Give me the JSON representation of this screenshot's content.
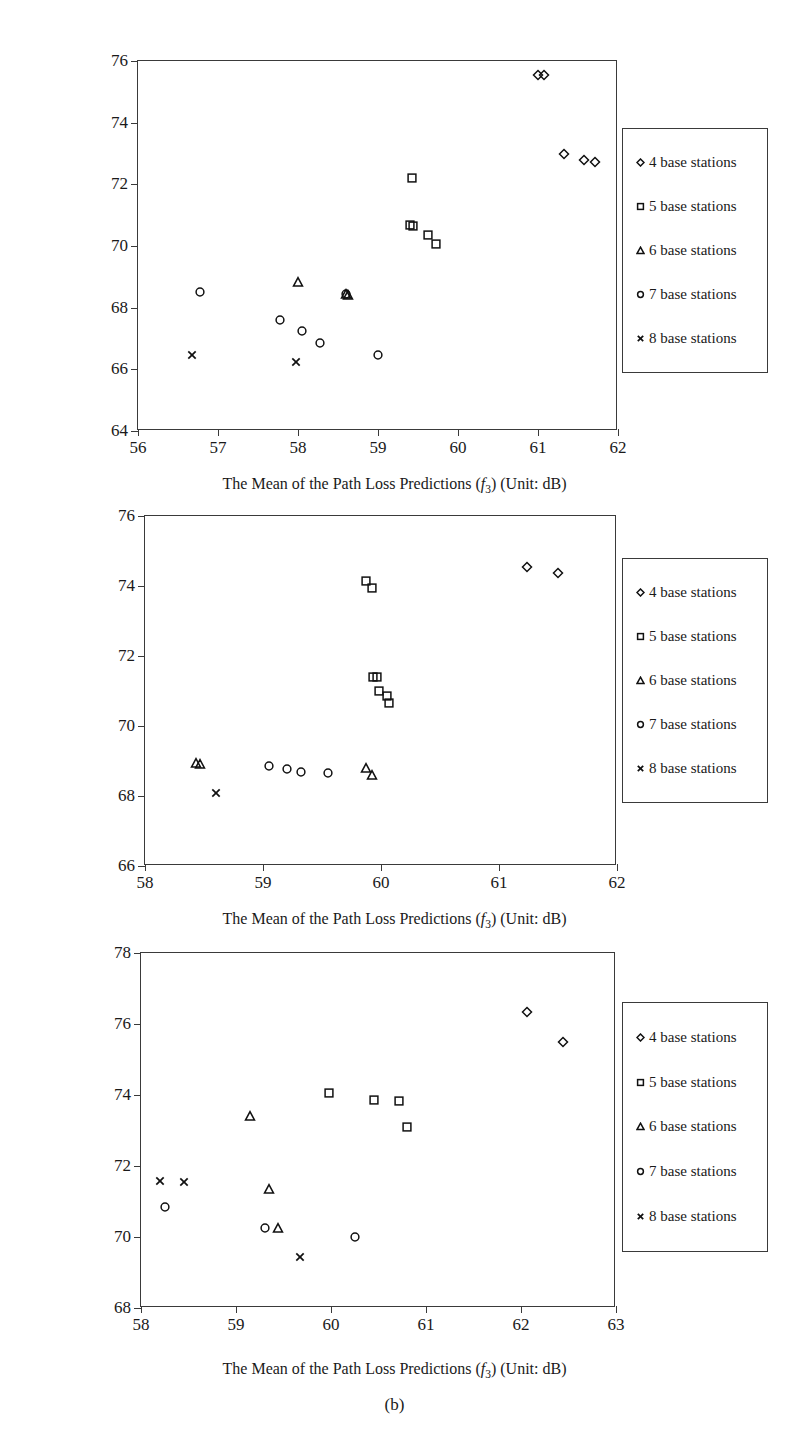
{
  "figure": {
    "caption": "(b)",
    "legend_labels": [
      "4 base stations",
      "5 base stations",
      "6 base stations",
      "7 base stations",
      "8 base stations"
    ],
    "legend_markers": [
      "diamond-marker",
      "square-marker",
      "triangle-marker",
      "circle-marker",
      "cross-marker"
    ],
    "axis_color": "#3a3a3a",
    "marker_color": "#111111"
  },
  "panels": [
    {
      "id": "a",
      "ylabel_line1": "The Mean of the Maximum Path Loss",
      "ylabel_line2": "predictions (f4) (Unit: dB)",
      "xlabel": "The Mean of the Path Loss Predictions (f3) (Unit: dB)",
      "xticks": [
        "56",
        "57",
        "58",
        "59",
        "60",
        "61",
        "62"
      ],
      "yticks": [
        "64",
        "66",
        "68",
        "70",
        "72",
        "74",
        "76"
      ]
    },
    {
      "id": "b",
      "ylabel_line1": "The Mean of the Maximum Path Loss",
      "ylabel_line2": "Predictions (f4) (Unit: dB)",
      "xlabel": "The Mean of the Path Loss Predictions (f3) (Unit: dB)",
      "xticks": [
        "58",
        "59",
        "60",
        "61",
        "62"
      ],
      "yticks": [
        "66",
        "68",
        "70",
        "72",
        "74",
        "76"
      ]
    },
    {
      "id": "c",
      "ylabel_line1": "The Mean of the Maximum Path Loss",
      "ylabel_line2": "Predictions (f4) (Unit: dB)",
      "xlabel": "The Mean of the Path Loss Predictions (f3) (Unit: dB)",
      "xticks": [
        "58",
        "59",
        "60",
        "61",
        "62",
        "63"
      ],
      "yticks": [
        "68",
        "70",
        "72",
        "74",
        "76",
        "78"
      ]
    }
  ],
  "chart_data": [
    {
      "type": "scatter",
      "panel": "top",
      "title": "",
      "xlabel": "The Mean of the Path Loss Predictions (f3) (Unit: dB)",
      "ylabel": "The Mean of the Maximum Path Loss predictions (f4) (Unit: dB)",
      "xlim": [
        56,
        62
      ],
      "ylim": [
        64,
        76
      ],
      "xticks": [
        56,
        57,
        58,
        59,
        60,
        61,
        62
      ],
      "yticks": [
        64,
        66,
        68,
        70,
        72,
        74,
        76
      ],
      "grid": false,
      "legend_position": "right-outside",
      "series": [
        {
          "name": "4 base stations",
          "marker": "diamond",
          "points": [
            [
              61.0,
              75.55
            ],
            [
              61.07,
              75.55
            ],
            [
              61.32,
              73.0
            ],
            [
              61.57,
              72.78
            ],
            [
              61.71,
              72.74
            ]
          ]
        },
        {
          "name": "5 base stations",
          "marker": "square",
          "points": [
            [
              59.42,
              72.2
            ],
            [
              59.4,
              70.68
            ],
            [
              59.44,
              70.65
            ],
            [
              59.62,
              70.35
            ],
            [
              59.72,
              70.05
            ]
          ]
        },
        {
          "name": "6 base stations",
          "marker": "triangle",
          "points": [
            [
              58.0,
              68.82
            ],
            [
              58.6,
              68.45
            ],
            [
              58.62,
              68.42
            ]
          ]
        },
        {
          "name": "7 base stations",
          "marker": "circle",
          "points": [
            [
              56.78,
              68.5
            ],
            [
              57.78,
              67.6
            ],
            [
              58.05,
              67.25
            ],
            [
              58.28,
              66.85
            ],
            [
              59.0,
              66.47
            ],
            [
              58.6,
              68.45
            ]
          ]
        },
        {
          "name": "8 base stations",
          "marker": "cross",
          "points": [
            [
              56.68,
              66.45
            ],
            [
              57.97,
              66.25
            ]
          ]
        }
      ]
    },
    {
      "type": "scatter",
      "panel": "middle",
      "title": "",
      "xlabel": "The Mean of the Path Loss Predictions (f3) (Unit: dB)",
      "ylabel": "The Mean of the Maximum Path Loss Predictions (f4) (Unit: dB)",
      "xlim": [
        58,
        62
      ],
      "ylim": [
        66,
        76
      ],
      "xticks": [
        58,
        59,
        60,
        61,
        62
      ],
      "yticks": [
        66,
        68,
        70,
        72,
        74,
        76
      ],
      "grid": false,
      "legend_position": "right-outside",
      "series": [
        {
          "name": "4 base stations",
          "marker": "diamond",
          "points": [
            [
              61.24,
              74.55
            ],
            [
              61.5,
              74.38
            ]
          ]
        },
        {
          "name": "5 base stations",
          "marker": "square",
          "points": [
            [
              59.87,
              74.13
            ],
            [
              59.92,
              73.95
            ],
            [
              59.93,
              71.4
            ],
            [
              59.97,
              71.4
            ],
            [
              59.98,
              71.0
            ],
            [
              60.05,
              70.85
            ],
            [
              60.07,
              70.65
            ]
          ]
        },
        {
          "name": "6 base stations",
          "marker": "triangle",
          "points": [
            [
              58.43,
              68.95
            ],
            [
              58.47,
              68.92
            ],
            [
              59.87,
              68.8
            ],
            [
              59.92,
              68.6
            ]
          ]
        },
        {
          "name": "7 base stations",
          "marker": "circle",
          "points": [
            [
              59.05,
              68.87
            ],
            [
              59.2,
              68.78
            ],
            [
              59.32,
              68.68
            ],
            [
              59.55,
              68.65
            ]
          ]
        },
        {
          "name": "8 base stations",
          "marker": "cross",
          "points": [
            [
              58.6,
              68.1
            ]
          ]
        }
      ]
    },
    {
      "type": "scatter",
      "panel": "bottom",
      "title": "",
      "xlabel": "The Mean of the Path Loss Predictions (f3) (Unit: dB)",
      "ylabel": "The Mean of the Maximum Path Loss Predictions (f4) (Unit: dB)",
      "xlim": [
        58,
        63
      ],
      "ylim": [
        68,
        78
      ],
      "xticks": [
        58,
        59,
        60,
        61,
        62,
        63
      ],
      "yticks": [
        68,
        70,
        72,
        74,
        76,
        78
      ],
      "grid": false,
      "legend_position": "right-outside",
      "series": [
        {
          "name": "4 base stations",
          "marker": "diamond",
          "points": [
            [
              62.06,
              76.35
            ],
            [
              62.44,
              75.48
            ]
          ]
        },
        {
          "name": "5 base stations",
          "marker": "square",
          "points": [
            [
              59.98,
              74.05
            ],
            [
              60.45,
              73.85
            ],
            [
              60.72,
              73.82
            ],
            [
              60.8,
              73.1
            ]
          ]
        },
        {
          "name": "6 base stations",
          "marker": "triangle",
          "points": [
            [
              59.15,
              73.4
            ],
            [
              59.35,
              71.35
            ],
            [
              59.44,
              70.25
            ]
          ]
        },
        {
          "name": "7 base stations",
          "marker": "circle",
          "points": [
            [
              58.25,
              70.85
            ],
            [
              59.3,
              70.25
            ],
            [
              60.25,
              70.0
            ]
          ]
        },
        {
          "name": "8 base stations",
          "marker": "cross",
          "points": [
            [
              58.2,
              71.58
            ],
            [
              58.45,
              71.55
            ],
            [
              59.67,
              69.45
            ]
          ]
        }
      ]
    }
  ]
}
